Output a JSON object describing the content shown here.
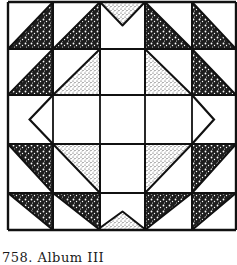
{
  "figure": {
    "caption": "758. Album III",
    "colors": {
      "line": "#111111",
      "background": "#ffffff",
      "dark_fabric": "#2a2a2a",
      "light_fabric": "#9a9a9a"
    },
    "grid": {
      "cols": 5,
      "rows": 5,
      "x_lines": [
        8,
        53,
        100,
        145,
        192,
        236
      ],
      "y_lines": [
        2,
        49,
        95,
        144,
        193,
        230
      ]
    },
    "cells": [
      [
        "dark-lower-right",
        "dark-lower-right",
        "light-top-inverted",
        "dark-lower-left",
        "dark-lower-left"
      ],
      [
        "dark-lower-right",
        "light-lower-right",
        "empty",
        "light-lower-left",
        "dark-lower-left"
      ],
      [
        "chevron-left",
        "empty",
        "empty",
        "empty",
        "chevron-right"
      ],
      [
        "dark-upper-right",
        "light-upper-right",
        "empty",
        "light-upper-left",
        "dark-upper-left"
      ],
      [
        "dark-upper-right",
        "dark-upper-right",
        "light-bottom-upright",
        "dark-upper-left",
        "dark-upper-left"
      ]
    ]
  }
}
